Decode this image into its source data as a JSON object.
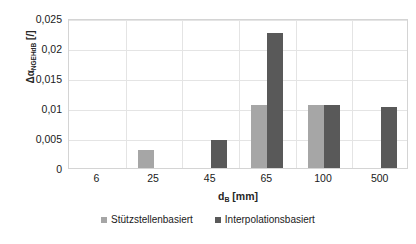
{
  "chart_data": {
    "type": "bar",
    "title": "",
    "xlabel": "d_B [mm]",
    "ylabel": "Δα_NGEHdB [/]",
    "categories": [
      "6",
      "25",
      "45",
      "65",
      "100",
      "500"
    ],
    "series": [
      {
        "name": "Stützstellenbasiert",
        "color": "#a6a6a6",
        "values": [
          0,
          0.003,
          0,
          0.0105,
          0.0105,
          0
        ]
      },
      {
        "name": "Interpolationsbasiert",
        "color": "#595959",
        "values": [
          0,
          0,
          0.0047,
          0.0225,
          0.0105,
          0.0102
        ]
      }
    ],
    "ylim": [
      0,
      0.025
    ],
    "yticks": [
      0,
      0.005,
      0.01,
      0.015,
      0.02,
      0.025
    ],
    "ytick_labels": [
      "0",
      "0,005",
      "0,01",
      "0,015",
      "0,02",
      "0,025"
    ],
    "grid": "horizontal-and-vertical",
    "legend_position": "bottom"
  },
  "axes": {
    "y_title_main": "Δα",
    "y_title_sub": "NGEHdB",
    "y_title_unit": " [/]",
    "x_title_main": "d",
    "x_title_sub": "B",
    "x_title_unit": " [mm]"
  },
  "legend": {
    "items": [
      {
        "label": "Stützstellenbasiert",
        "color": "#a6a6a6"
      },
      {
        "label": "Interpolationsbasiert",
        "color": "#595959"
      }
    ]
  }
}
